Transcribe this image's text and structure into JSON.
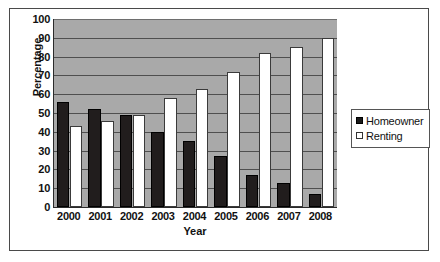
{
  "chart_data": {
    "type": "bar",
    "title": "",
    "xlabel": "Year",
    "ylabel": "Percentage",
    "categories": [
      "2000",
      "2001",
      "2002",
      "2003",
      "2004",
      "2005",
      "2006",
      "2007",
      "2008"
    ],
    "series": [
      {
        "name": "Homeowner",
        "values": [
          56,
          52,
          49,
          40,
          35,
          27,
          17,
          13,
          7
        ]
      },
      {
        "name": "Renting",
        "values": [
          43,
          46,
          49,
          58,
          63,
          72,
          82,
          85,
          90
        ]
      }
    ],
    "ylim": [
      0,
      100
    ],
    "ytick_step": 10,
    "yticks": [
      "100",
      "90",
      "80",
      "70",
      "60",
      "50",
      "40",
      "30",
      "20",
      "10",
      "0"
    ],
    "grid": true,
    "legend_position": "right",
    "colors": {
      "homeowner": "#211d1d",
      "renting": "#ffffff",
      "plot_background": "#a9a9a9",
      "gridline": "#4f4f4f",
      "axis": "#2b2b2b",
      "frame": "#4a4a4a",
      "page_background": "#ffffff",
      "text": "#111111"
    }
  },
  "legend": {
    "items": [
      {
        "label": "Homeowner",
        "swatch": "filled-square-icon"
      },
      {
        "label": "Renting",
        "swatch": "hollow-square-icon"
      }
    ]
  }
}
